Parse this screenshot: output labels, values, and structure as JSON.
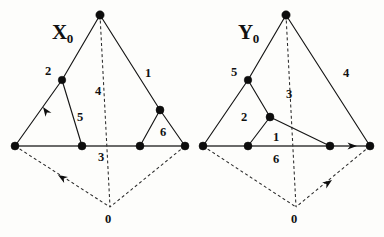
{
  "figure": {
    "width": 384,
    "height": 237,
    "background_color": "#fdfdfb",
    "ink_color": "#111111"
  },
  "panels": [
    {
      "id": "panel-x0",
      "name_label": {
        "base": "X",
        "subscript": "0",
        "x": 52,
        "y": 22
      },
      "apex_label": null,
      "number_labels": [
        {
          "text": "2",
          "x": 45,
          "y": 65,
          "name": "edge-label-2"
        },
        {
          "text": "1",
          "x": 145,
          "y": 67,
          "name": "edge-label-1"
        },
        {
          "text": "4",
          "x": 95,
          "y": 85,
          "name": "edge-label-4"
        },
        {
          "text": "5",
          "x": 77,
          "y": 111,
          "name": "region-label-5"
        },
        {
          "text": "6",
          "x": 160,
          "y": 126,
          "name": "region-label-6"
        },
        {
          "text": "3",
          "x": 98,
          "y": 151,
          "name": "edge-label-3"
        },
        {
          "text": "0",
          "x": 105,
          "y": 213,
          "name": "vertex-label-0"
        }
      ],
      "vertices": [
        {
          "name": "apex-vertex",
          "x": 100,
          "y": 15,
          "r": 4.2
        },
        {
          "name": "upper-left-vertex",
          "x": 62,
          "y": 80,
          "r": 3.8
        },
        {
          "name": "left-base-vertex",
          "x": 15,
          "y": 146,
          "r": 4.0
        },
        {
          "name": "inner-left-vertex",
          "x": 82,
          "y": 146,
          "r": 4.0
        },
        {
          "name": "inner-right-vertex",
          "x": 140,
          "y": 146,
          "r": 4.0
        },
        {
          "name": "right-base-vertex",
          "x": 185,
          "y": 146,
          "r": 4.0
        },
        {
          "name": "upper-right-vertex",
          "x": 160,
          "y": 110,
          "r": 4.0
        },
        {
          "name": "bottom-vertex-0",
          "x": 110,
          "y": 207,
          "r": 0
        }
      ],
      "solid_edges": [
        {
          "name": "edge-apex-to-upper-left",
          "x1": 100,
          "y1": 15,
          "x2": 62,
          "y2": 80
        },
        {
          "name": "edge-upper-left-to-left-base",
          "x1": 62,
          "y1": 80,
          "x2": 15,
          "y2": 146
        },
        {
          "name": "edge-upper-left-to-inner-left",
          "x1": 62,
          "y1": 80,
          "x2": 82,
          "y2": 146
        },
        {
          "name": "edge-apex-to-upper-right",
          "x1": 100,
          "y1": 15,
          "x2": 160,
          "y2": 110
        },
        {
          "name": "edge-upper-right-to-inner-right",
          "x1": 160,
          "y1": 110,
          "x2": 140,
          "y2": 146
        },
        {
          "name": "edge-upper-right-to-right-base",
          "x1": 160,
          "y1": 110,
          "x2": 185,
          "y2": 146
        }
      ],
      "baseline_edges": [
        {
          "name": "baseline-segment",
          "x1": 15,
          "y1": 146,
          "x2": 185,
          "y2": 146
        }
      ],
      "dashed_edges": [
        {
          "name": "dashed-apex-to-vertex0",
          "x1": 100,
          "y1": 15,
          "x2": 110,
          "y2": 207
        },
        {
          "name": "dashed-left-base-to-vertex0",
          "x1": 15,
          "y1": 146,
          "x2": 110,
          "y2": 207
        },
        {
          "name": "dashed-right-base-to-vertex0",
          "x1": 185,
          "y1": 146,
          "x2": 110,
          "y2": 207
        }
      ],
      "arrows": [
        {
          "name": "arrow-up-left-edge",
          "x": 43,
          "y": 107,
          "angle": -125,
          "style": "solid"
        },
        {
          "name": "arrow-dashed-to-left-base",
          "x": 58,
          "y": 175,
          "angle": -148,
          "style": "dashed"
        }
      ]
    },
    {
      "id": "panel-y0",
      "name_label": {
        "base": "Y",
        "subscript": "0",
        "x": 238,
        "y": 22
      },
      "number_labels": [
        {
          "text": "5",
          "x": 231,
          "y": 66,
          "name": "edge-label-5"
        },
        {
          "text": "4",
          "x": 343,
          "y": 67,
          "name": "edge-label-4"
        },
        {
          "text": "3",
          "x": 286,
          "y": 88,
          "name": "edge-label-3"
        },
        {
          "text": "2",
          "x": 241,
          "y": 111,
          "name": "region-label-2"
        },
        {
          "text": "1",
          "x": 273,
          "y": 131,
          "name": "region-label-1"
        },
        {
          "text": "6",
          "x": 273,
          "y": 153,
          "name": "edge-label-6"
        },
        {
          "text": "0",
          "x": 291,
          "y": 213,
          "name": "vertex-label-0"
        }
      ],
      "vertices": [
        {
          "name": "apex-vertex",
          "x": 286,
          "y": 15,
          "r": 4.2
        },
        {
          "name": "upper-left-vertex",
          "x": 248,
          "y": 80,
          "r": 3.8
        },
        {
          "name": "mid-inner-vertex",
          "x": 270,
          "y": 117,
          "r": 4.0
        },
        {
          "name": "left-base-vertex",
          "x": 203,
          "y": 146,
          "r": 4.0
        },
        {
          "name": "inner-left-vertex",
          "x": 248,
          "y": 146,
          "r": 4.0
        },
        {
          "name": "inner-right-vertex",
          "x": 330,
          "y": 146,
          "r": 4.0
        },
        {
          "name": "right-base-vertex",
          "x": 370,
          "y": 146,
          "r": 4.0
        },
        {
          "name": "bottom-vertex-0",
          "x": 296,
          "y": 207,
          "r": 0
        }
      ],
      "solid_edges": [
        {
          "name": "edge-apex-to-upper-left",
          "x1": 286,
          "y1": 15,
          "x2": 248,
          "y2": 80
        },
        {
          "name": "edge-upper-left-to-left-base",
          "x1": 248,
          "y1": 80,
          "x2": 203,
          "y2": 146
        },
        {
          "name": "edge-upper-left-to-mid-inner",
          "x1": 248,
          "y1": 80,
          "x2": 270,
          "y2": 117
        },
        {
          "name": "edge-mid-inner-to-inner-left",
          "x1": 270,
          "y1": 117,
          "x2": 248,
          "y2": 146
        },
        {
          "name": "edge-mid-inner-to-inner-right",
          "x1": 270,
          "y1": 117,
          "x2": 330,
          "y2": 146
        },
        {
          "name": "edge-apex-to-right-base",
          "x1": 286,
          "y1": 15,
          "x2": 370,
          "y2": 146
        }
      ],
      "baseline_edges": [
        {
          "name": "baseline-segment",
          "x1": 203,
          "y1": 146,
          "x2": 370,
          "y2": 146
        }
      ],
      "dashed_edges": [
        {
          "name": "dashed-apex-to-vertex0",
          "x1": 286,
          "y1": 15,
          "x2": 296,
          "y2": 207
        },
        {
          "name": "dashed-left-base-to-vertex0",
          "x1": 203,
          "y1": 146,
          "x2": 296,
          "y2": 207
        },
        {
          "name": "dashed-right-base-to-vertex0",
          "x1": 370,
          "y1": 146,
          "x2": 296,
          "y2": 207
        }
      ],
      "arrows": [
        {
          "name": "arrow-right-baseline",
          "x": 357,
          "y": 146,
          "angle": 0,
          "style": "solid"
        },
        {
          "name": "arrow-dashed-to-right-base",
          "x": 332,
          "y": 180,
          "angle": -35,
          "style": "dashed"
        }
      ]
    }
  ]
}
